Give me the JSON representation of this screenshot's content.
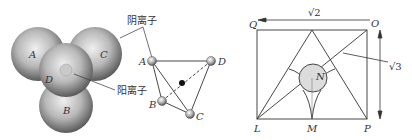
{
  "figure1": {
    "spheres": [
      "A",
      "B",
      "C",
      "D"
    ],
    "anion_label": "阴离子",
    "cation_label": "阳离子"
  },
  "figure2": {
    "vertices": [
      "A",
      "B",
      "C",
      "D"
    ]
  },
  "figure3": {
    "corners": {
      "top_left": "Q",
      "top_right": "O",
      "bottom_left": "L",
      "bottom_mid": "M",
      "bottom_right": "P"
    },
    "center": "N",
    "width_label": "√2",
    "height_label": "√3"
  },
  "colors": {
    "line": "#333333",
    "sphere_dark": "#555555",
    "sphere_light": "#e6e6e6",
    "circle_fill": "#dcdcdc"
  }
}
